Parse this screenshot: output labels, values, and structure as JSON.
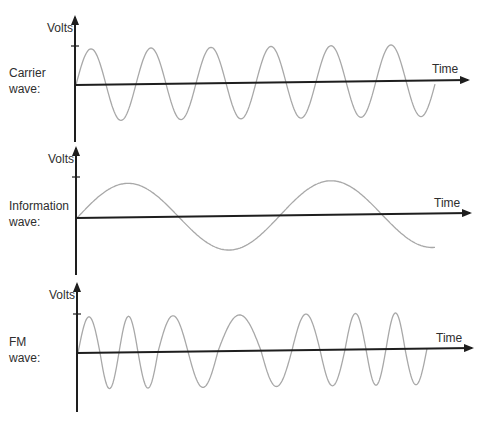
{
  "colors": {
    "axis": "#1e1e1e",
    "wave": "#a8a8a8",
    "text": "#2e2e2e"
  },
  "panels": [
    {
      "id": "carrier",
      "label_line1": "Carrier",
      "label_line2": "wave:",
      "y_label": "Volts",
      "x_label": "Time",
      "y_axis": {
        "x": 75,
        "top": 17,
        "bottom": 142,
        "tick_y": 46
      },
      "x_axis": {
        "x0": 75,
        "y0": 85,
        "x1": 468,
        "y1": 80
      },
      "label_pos": {
        "volts_y": 31,
        "line1_y": 72,
        "line2_y": 88,
        "time_x": 432,
        "time_y": 62
      },
      "wave": {
        "type": "sine",
        "start_x": 76,
        "end_x": 435,
        "amplitude": 36,
        "period_px": 60,
        "description": "constant-frequency carrier, ~6 cycles"
      }
    },
    {
      "id": "information",
      "label_line1": "Information",
      "label_line2": "wave:",
      "y_label": "Volts",
      "x_label": "Time",
      "y_axis": {
        "x": 76,
        "top": 148,
        "bottom": 275,
        "tick_y": 177
      },
      "x_axis": {
        "x0": 76,
        "y0": 218,
        "x1": 470,
        "y1": 213
      },
      "label_pos": {
        "volts_y": 162,
        "line1_y": 205,
        "line2_y": 221,
        "time_x": 434,
        "time_y": 196
      },
      "wave": {
        "type": "sine",
        "start_x": 77,
        "end_x": 435,
        "amplitude": 34,
        "period_px": 203,
        "description": "low-frequency information signal, ~1.75 cycles"
      }
    },
    {
      "id": "fm",
      "label_line1": "FM",
      "label_line2": "wave:",
      "y_label": "Volts",
      "x_label": "Time",
      "y_axis": {
        "x": 77,
        "top": 284,
        "bottom": 412,
        "tick_y": 314
      },
      "x_axis": {
        "x0": 77,
        "y0": 353,
        "x1": 472,
        "y1": 348
      },
      "label_pos": {
        "volts_y": 298,
        "line1_y": 341,
        "line2_y": 357,
        "time_x": 436,
        "time_y": 331
      },
      "wave": {
        "type": "fm",
        "start_x": 78,
        "end_x": 427,
        "amplitude": 36,
        "zero_crossings_x": [
          78,
          100,
          119,
          138,
          158,
          188,
          218,
          261,
          292,
          320,
          345,
          366,
          386,
          405,
          427
        ],
        "description": "frequency increases where information wave is low, decreases where it is high"
      }
    }
  ]
}
